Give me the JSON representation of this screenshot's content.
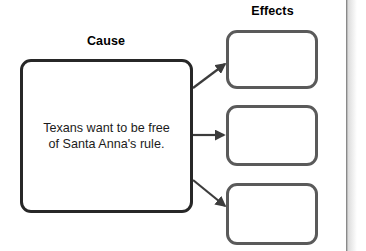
{
  "diagram": {
    "type": "cause-and-effect-graphic-organizer",
    "cause_heading": "Cause",
    "effects_heading": "Effects",
    "cause_text": "Texans want to be free\nof Santa Anna's rule.",
    "effects": [
      {
        "label": "",
        "placeholder": ""
      },
      {
        "label": "",
        "placeholder": ""
      },
      {
        "label": "",
        "placeholder": ""
      }
    ],
    "connectors": [
      {
        "name": "arrow-to-effect-1",
        "direction": "up-right"
      },
      {
        "name": "arrow-to-effect-2",
        "direction": "right"
      },
      {
        "name": "arrow-to-effect-3",
        "direction": "down-right"
      }
    ],
    "colors": {
      "background": "#ffffff",
      "cause_border": "#272727",
      "effect_border": "#5a5a5a",
      "arrow": "#3c3c3c",
      "text": "#1b1b1b",
      "heading": "#000000",
      "page_edge": "#8c8c8c"
    }
  }
}
